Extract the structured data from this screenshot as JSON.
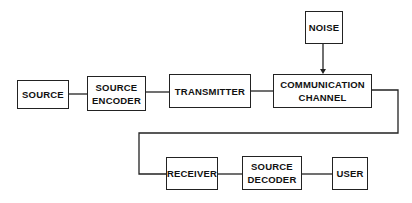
{
  "diagram": {
    "colors": {
      "line": "#222222",
      "text": "#111111",
      "background": "#ffffff"
    },
    "blocks": {
      "source": {
        "lines": [
          "SOURCE"
        ]
      },
      "source_encoder": {
        "lines": [
          "SOURCE",
          "ENCODER"
        ]
      },
      "transmitter": {
        "lines": [
          "TRANSMITTER"
        ]
      },
      "noise": {
        "lines": [
          "NOISE"
        ]
      },
      "channel": {
        "lines": [
          "COMMUNICATION",
          "CHANNEL"
        ]
      },
      "receiver": {
        "lines": [
          "RECEIVER"
        ]
      },
      "source_decoder": {
        "lines": [
          "SOURCE",
          "DECODER"
        ]
      },
      "user": {
        "lines": [
          "USER"
        ]
      }
    },
    "connections": [
      {
        "from": "SOURCE",
        "to": "SOURCE ENCODER"
      },
      {
        "from": "SOURCE ENCODER",
        "to": "TRANSMITTER"
      },
      {
        "from": "TRANSMITTER",
        "to": "COMMUNICATION CHANNEL"
      },
      {
        "from": "NOISE",
        "to": "COMMUNICATION CHANNEL",
        "arrow": true
      },
      {
        "from": "COMMUNICATION CHANNEL",
        "to": "RECEIVER"
      },
      {
        "from": "RECEIVER",
        "to": "SOURCE DECODER"
      },
      {
        "from": "SOURCE DECODER",
        "to": "USER"
      }
    ]
  }
}
